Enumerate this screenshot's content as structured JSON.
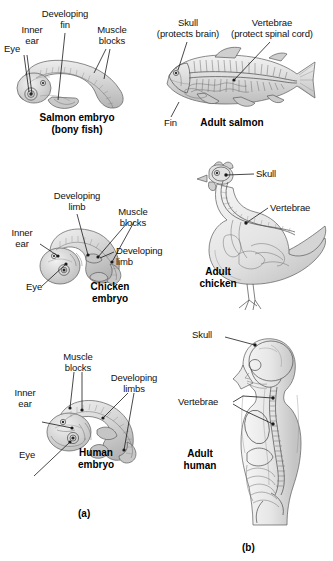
{
  "figure": {
    "panel_a_label": "(a)",
    "panel_b_label": "(b)",
    "ink_color": "#1a1a1a",
    "body_fill": "#d8d8d8"
  },
  "rows": [
    {
      "embryo": {
        "caption_line1": "Salmon embryo",
        "caption_line2": "(bony fish)",
        "labels": {
          "eye": "Eye",
          "inner_ear_line1": "Inner",
          "inner_ear_line2": "ear",
          "developing_line1": "Developing",
          "developing_line2": "fin",
          "muscle_line1": "Muscle",
          "muscle_line2": "blocks"
        }
      },
      "adult": {
        "caption": "Adult salmon",
        "labels": {
          "skull_line1": "Skull",
          "skull_line2": "(protects brain)",
          "vertebrae_line1": "Vertebrae",
          "vertebrae_line2": "(protect spinal cord)",
          "fin": "Fin"
        }
      }
    },
    {
      "embryo": {
        "caption_line1": "Chicken",
        "caption_line2": "embryo",
        "labels": {
          "eye": "Eye",
          "inner_ear_line1": "Inner",
          "inner_ear_line2": "ear",
          "developing_top_line1": "Developing",
          "developing_top_line2": "limb",
          "muscle_line1": "Muscle",
          "muscle_line2": "blocks",
          "developing_right_line1": "Developing",
          "developing_right_line2": "limb"
        }
      },
      "adult": {
        "caption_line1": "Adult",
        "caption_line2": "chicken",
        "labels": {
          "skull": "Skull",
          "vertebrae": "Vertebrae"
        }
      }
    },
    {
      "embryo": {
        "caption_line1": "Human",
        "caption_line2": "embryo",
        "labels": {
          "eye": "Eye",
          "inner_ear_line1": "Inner",
          "inner_ear_line2": "ear",
          "muscle_line1": "Muscle",
          "muscle_line2": "blocks",
          "developing_line1": "Developing",
          "developing_line2": "limbs"
        }
      },
      "adult": {
        "caption_line1": "Adult",
        "caption_line2": "human",
        "labels": {
          "skull": "Skull",
          "vertebrae": "Vertebrae"
        }
      }
    }
  ]
}
